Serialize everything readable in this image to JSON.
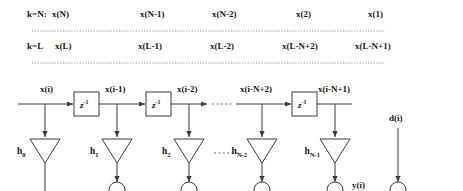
{
  "figure": {
    "type": "signal-flow-diagram"
  },
  "index_table": {
    "rows": [
      {
        "key": "k=N:",
        "cells": [
          "x(N)",
          "x(N-1)",
          "x(N-2)",
          "x(2)",
          "x(1)"
        ]
      },
      {
        "key": "k=L",
        "cells": [
          "x(L)",
          "x(L-1)",
          "x(L-2)",
          "x(L-N+2)",
          "x(L-N+1)"
        ]
      }
    ]
  },
  "separators": {
    "upper_dotted": "dotted-rule",
    "lower_dotted": "dotted-rule"
  },
  "delay_line": {
    "tap_signals": [
      "x(i)",
      "x(i-1)",
      "x(i-2)",
      "x(i-N+2)",
      "x(i-N+1)"
    ],
    "delay_blocks": [
      {
        "label": "z",
        "exponent": "-1"
      },
      {
        "label": "z",
        "exponent": "-1"
      },
      {
        "label": "z",
        "exponent": "-1"
      }
    ],
    "ellipsis": "- - - -"
  },
  "gains": {
    "labels": [
      "h",
      "h",
      "h",
      "h",
      "h"
    ],
    "subscripts": [
      "0",
      "1",
      "2",
      "N-2",
      "N-1"
    ],
    "ellipsis": "- - - -"
  },
  "outputs": {
    "filter_output": "y(i)",
    "desired_signal": "d(i)"
  },
  "colors": {
    "line": "#3a3a3a",
    "text": "#161616",
    "background": "#ffffff",
    "dotted": "#8a8a8a"
  }
}
